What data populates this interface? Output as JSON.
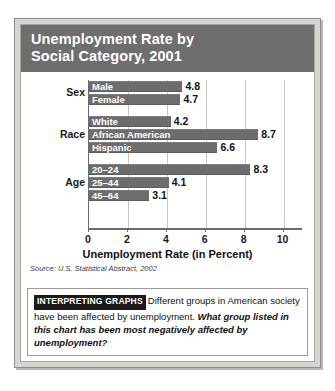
{
  "figure": {
    "title_line1": "Unemployment Rate by",
    "title_line2": "Social Category, 2001",
    "source": "Source: U.S. Statistical Abstract, 2002"
  },
  "caption": {
    "badge": "INTERPRETING GRAPHS",
    "body": "Different groups in American society have been affected by unemployment.",
    "question": "What group listed in this chart has been most negatively affected by unemployment?"
  },
  "colors": {
    "banner": "#6e6e6e",
    "bar": "#6d6d6d",
    "frame": "#d7d5d2",
    "badge": "#1a1a1a",
    "gridline": "#c6c6c6",
    "axis": "#6b6b6b"
  },
  "chart_data": {
    "type": "bar",
    "orientation": "horizontal",
    "title": "Unemployment Rate by Social Category, 2001",
    "xlabel": "Unemployment Rate (in Percent)",
    "ylabel": "",
    "xlim": [
      0,
      11
    ],
    "xticks": [
      0,
      2,
      4,
      6,
      8,
      10
    ],
    "grid": true,
    "legend": false,
    "source": "Source: U.S. Statistical Abstract, 2002",
    "groups": [
      {
        "label": "Sex",
        "categories": [
          "Male",
          "Female"
        ],
        "values": [
          4.8,
          4.7
        ]
      },
      {
        "label": "Race",
        "categories": [
          "White",
          "African American",
          "Hispanic"
        ],
        "values": [
          4.2,
          8.7,
          6.6
        ]
      },
      {
        "label": "Age",
        "categories": [
          "20–24",
          "25–44",
          "45–64"
        ],
        "values": [
          8.3,
          4.1,
          3.1
        ]
      }
    ],
    "categories": [
      "Male",
      "Female",
      "White",
      "African American",
      "Hispanic",
      "20–24",
      "25–44",
      "45–64"
    ],
    "values": [
      4.8,
      4.7,
      4.2,
      8.7,
      6.6,
      8.3,
      4.1,
      3.1
    ]
  }
}
